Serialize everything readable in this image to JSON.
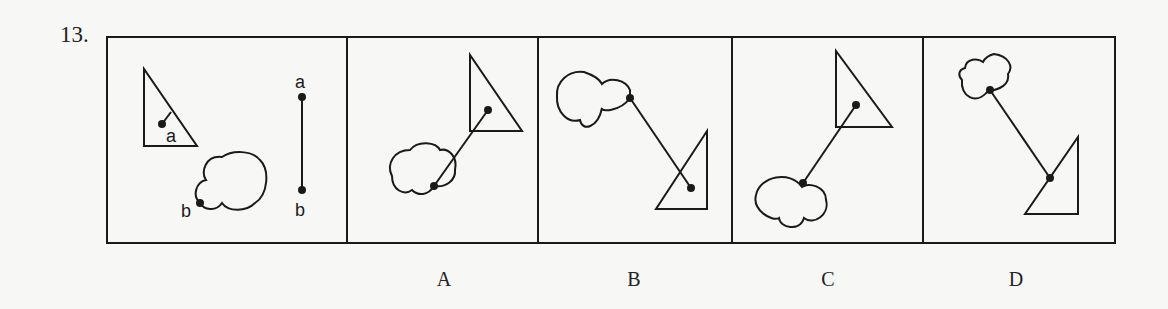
{
  "question": {
    "number": "13."
  },
  "stem_panel": {
    "triangle_point_label": "a",
    "cloud_point_label": "b",
    "segment_top_label": "a",
    "segment_bottom_label": "b"
  },
  "options": [
    {
      "label": "A",
      "description": "Cloud at lower-left joined by segment to point inside triangle at upper-right"
    },
    {
      "label": "B",
      "description": "Cloud at upper-left with edge point joined by segment to point inside triangle at lower-right"
    },
    {
      "label": "C",
      "description": "Cloud at lower-left (point inside cloud) joined by segment to point inside triangle at upper-right"
    },
    {
      "label": "D",
      "description": "Cloud at upper-left (point inside cloud) joined by segment to point on hypotenuse of triangle at lower-right"
    }
  ],
  "colors": {
    "ink": "#1a1a1a",
    "paper": "#f7f7f5"
  }
}
